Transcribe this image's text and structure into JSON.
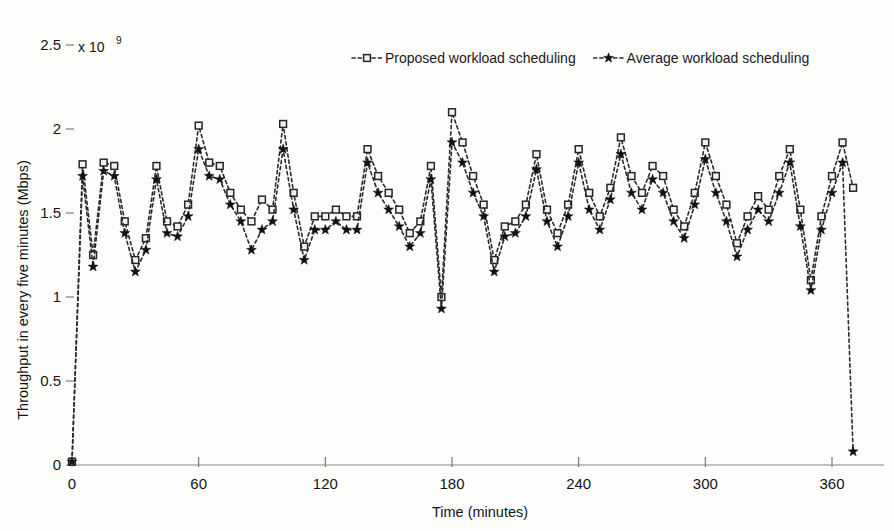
{
  "chart_data": {
    "type": "line",
    "title": "",
    "xlabel": "Time (minutes)",
    "ylabel": "Throughput in every five minutes (Mbps)",
    "y_multiplier_base": "x 10",
    "y_multiplier_exponent": "9",
    "xlim": [
      0,
      378
    ],
    "ylim": [
      0,
      2.5
    ],
    "xticks": [
      0,
      60,
      120,
      180,
      240,
      300,
      360
    ],
    "xticklabels": [
      "0",
      "60",
      "120",
      "180",
      "240",
      "300",
      "360"
    ],
    "yticks": [
      0,
      0.5,
      1,
      1.5,
      2,
      2.5
    ],
    "yticklabels": [
      "0",
      "0.5",
      "1",
      "1.5",
      "2",
      "2.5"
    ],
    "grid": false,
    "legend_position": "top-center",
    "legend": [
      {
        "label": "Proposed workload scheduling",
        "marker": "square",
        "linestyle": "dashed"
      },
      {
        "label": "Average workload scheduling",
        "marker": "star",
        "linestyle": "dashed"
      }
    ],
    "x": [
      0,
      5,
      10,
      15,
      20,
      25,
      30,
      35,
      40,
      45,
      50,
      55,
      60,
      65,
      70,
      75,
      80,
      85,
      90,
      95,
      100,
      105,
      110,
      115,
      120,
      125,
      130,
      135,
      140,
      145,
      150,
      155,
      160,
      165,
      170,
      175,
      180,
      185,
      190,
      195,
      200,
      205,
      210,
      215,
      220,
      225,
      230,
      235,
      240,
      245,
      250,
      255,
      260,
      265,
      270,
      275,
      280,
      285,
      290,
      295,
      300,
      305,
      310,
      315,
      320,
      325,
      330,
      335,
      340,
      345,
      350,
      355,
      360,
      365,
      370
    ],
    "series": [
      {
        "name": "Proposed workload scheduling",
        "marker": "square",
        "values": [
          0.02,
          1.79,
          1.25,
          1.8,
          1.78,
          1.45,
          1.22,
          1.35,
          1.78,
          1.45,
          1.42,
          1.55,
          2.02,
          1.8,
          1.78,
          1.62,
          1.52,
          1.45,
          1.58,
          1.52,
          2.03,
          1.62,
          1.3,
          1.48,
          1.48,
          1.52,
          1.48,
          1.48,
          1.88,
          1.72,
          1.62,
          1.52,
          1.38,
          1.45,
          1.78,
          1.0,
          2.1,
          1.92,
          1.72,
          1.55,
          1.22,
          1.42,
          1.45,
          1.55,
          1.85,
          1.52,
          1.38,
          1.55,
          1.88,
          1.62,
          1.48,
          1.65,
          1.95,
          1.72,
          1.62,
          1.78,
          1.72,
          1.52,
          1.42,
          1.62,
          1.92,
          1.72,
          1.55,
          1.32,
          1.48,
          1.6,
          1.52,
          1.72,
          1.88,
          1.52,
          1.1,
          1.48,
          1.72,
          1.92,
          1.65
        ]
      },
      {
        "name": "Average workload scheduling",
        "marker": "star",
        "values": [
          0.02,
          1.72,
          1.18,
          1.75,
          1.72,
          1.38,
          1.15,
          1.28,
          1.7,
          1.38,
          1.36,
          1.48,
          1.88,
          1.72,
          1.7,
          1.55,
          1.45,
          1.28,
          1.4,
          1.45,
          1.88,
          1.52,
          1.22,
          1.4,
          1.4,
          1.45,
          1.4,
          1.4,
          1.8,
          1.62,
          1.52,
          1.42,
          1.3,
          1.38,
          1.7,
          0.93,
          1.92,
          1.8,
          1.62,
          1.48,
          1.15,
          1.36,
          1.38,
          1.48,
          1.76,
          1.45,
          1.3,
          1.48,
          1.8,
          1.52,
          1.4,
          1.58,
          1.85,
          1.62,
          1.52,
          1.7,
          1.62,
          1.45,
          1.35,
          1.55,
          1.82,
          1.62,
          1.45,
          1.24,
          1.4,
          1.52,
          1.45,
          1.62,
          1.8,
          1.42,
          1.04,
          1.4,
          1.62,
          1.8,
          0.08
        ]
      }
    ]
  }
}
